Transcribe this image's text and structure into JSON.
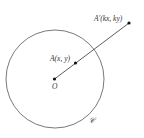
{
  "diagram": {
    "circle": {
      "label": "𝒞",
      "cx": 55,
      "cy": 79,
      "r": 49
    },
    "points": {
      "origin": {
        "label": "O",
        "x": 54.5,
        "y": 79
      },
      "a": {
        "label": "A(x, y)",
        "x": 75.5,
        "y": 63
      },
      "a_prime": {
        "label": "A'(kx, ky)",
        "x": 129,
        "y": 23
      }
    },
    "colors": {
      "line": "#333333",
      "circle": "#555555",
      "point": "#111111"
    }
  }
}
